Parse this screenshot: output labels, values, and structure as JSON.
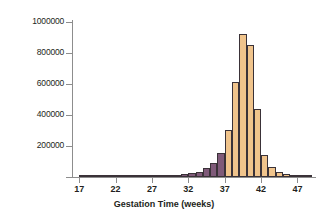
{
  "chart_data": {
    "type": "bar",
    "title": "",
    "subtitle": "",
    "xlabel": "Gestation Time (weeks)",
    "ylabel": "Births",
    "xlim": [
      16,
      49
    ],
    "ylim": [
      0,
      1000000
    ],
    "grid": false,
    "legend": false,
    "bin_width": 1,
    "x_ticks": [
      "17",
      "22",
      "27",
      "32",
      "37",
      "42",
      "47"
    ],
    "x_tick_values": [
      17,
      22,
      27,
      32,
      37,
      42,
      47
    ],
    "y_ticks": [
      "200000",
      "400000",
      "600000",
      "800000",
      "1000000"
    ],
    "y_tick_values": [
      200000,
      400000,
      600000,
      800000,
      1000000
    ],
    "colors": {
      "preterm": "#7f5a79",
      "term": "#f0c48c",
      "bar_outline": "#3a3238",
      "axis": "#8d8d8d",
      "text": "#231f20",
      "background": "#ffffff"
    },
    "series": [
      {
        "name": "Preterm births (< 37 weeks)",
        "color": "#7f5a79",
        "bins": [
          {
            "x": 17,
            "value": 1500
          },
          {
            "x": 18,
            "value": 1600
          },
          {
            "x": 19,
            "value": 1800
          },
          {
            "x": 20,
            "value": 2000
          },
          {
            "x": 21,
            "value": 2200
          },
          {
            "x": 22,
            "value": 2500
          },
          {
            "x": 23,
            "value": 3000
          },
          {
            "x": 24,
            "value": 3500
          },
          {
            "x": 25,
            "value": 4000
          },
          {
            "x": 26,
            "value": 4500
          },
          {
            "x": 27,
            "value": 5500
          },
          {
            "x": 28,
            "value": 7000
          },
          {
            "x": 29,
            "value": 9000
          },
          {
            "x": 30,
            "value": 13000
          },
          {
            "x": 31,
            "value": 17000
          },
          {
            "x": 32,
            "value": 24000
          },
          {
            "x": 33,
            "value": 33000
          },
          {
            "x": 34,
            "value": 55000
          },
          {
            "x": 35,
            "value": 90000
          },
          {
            "x": 36,
            "value": 155000
          }
        ]
      },
      {
        "name": "Term births (>= 37 weeks)",
        "color": "#f0c48c",
        "bins": [
          {
            "x": 37,
            "value": 305000
          },
          {
            "x": 38,
            "value": 615000
          },
          {
            "x": 39,
            "value": 920000
          },
          {
            "x": 40,
            "value": 850000
          },
          {
            "x": 41,
            "value": 440000
          },
          {
            "x": 42,
            "value": 140000
          },
          {
            "x": 43,
            "value": 65000
          },
          {
            "x": 44,
            "value": 30000
          },
          {
            "x": 45,
            "value": 18000
          },
          {
            "x": 46,
            "value": 10000
          },
          {
            "x": 47,
            "value": 5000
          },
          {
            "x": 48,
            "value": 2500
          }
        ]
      }
    ]
  }
}
